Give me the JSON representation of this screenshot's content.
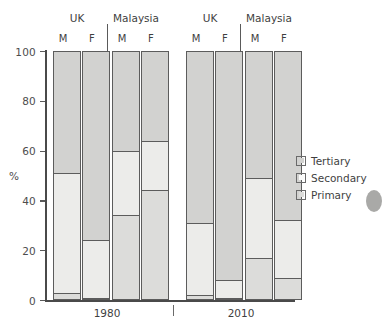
{
  "chart_data": {
    "type": "bar",
    "subtype": "stacked-100-percent",
    "title": "",
    "xlabel": "",
    "ylabel": "%",
    "ylim": [
      0,
      100
    ],
    "yticks": [
      0,
      20,
      40,
      60,
      80,
      100
    ],
    "grid": false,
    "legend_position": "right",
    "groups": [
      {
        "period": "1980",
        "countries": [
          {
            "name": "UK",
            "bars": [
              {
                "sex": "M",
                "primary": 3,
                "secondary": 48,
                "tertiary": 49,
                "cum_primary_top": 3,
                "cum_secondary_top": 51
              },
              {
                "sex": "F",
                "primary": 1,
                "secondary": 23,
                "tertiary": 76,
                "cum_primary_top": 1,
                "cum_secondary_top": 24
              }
            ]
          },
          {
            "name": "Malaysia",
            "bars": [
              {
                "sex": "M",
                "primary": 34,
                "secondary": 26,
                "tertiary": 40,
                "cum_primary_top": 34,
                "cum_secondary_top": 60
              },
              {
                "sex": "F",
                "primary": 44,
                "secondary": 20,
                "tertiary": 36,
                "cum_primary_top": 44,
                "cum_secondary_top": 64
              }
            ]
          }
        ]
      },
      {
        "period": "2010",
        "countries": [
          {
            "name": "UK",
            "bars": [
              {
                "sex": "M",
                "primary": 2,
                "secondary": 29,
                "tertiary": 69,
                "cum_primary_top": 2,
                "cum_secondary_top": 31
              },
              {
                "sex": "F",
                "primary": 1,
                "secondary": 7,
                "tertiary": 92,
                "cum_primary_top": 1,
                "cum_secondary_top": 8
              }
            ]
          },
          {
            "name": "Malaysia",
            "bars": [
              {
                "sex": "M",
                "primary": 17,
                "secondary": 32,
                "tertiary": 51,
                "cum_primary_top": 17,
                "cum_secondary_top": 49
              },
              {
                "sex": "F",
                "primary": 9,
                "secondary": 23,
                "tertiary": 68,
                "cum_primary_top": 9,
                "cum_secondary_top": 32
              }
            ]
          }
        ]
      }
    ],
    "series": [
      {
        "name": "Tertiary",
        "color": "#d2d2d0",
        "values": [
          49,
          76,
          40,
          36,
          69,
          92,
          51,
          68
        ]
      },
      {
        "name": "Secondary",
        "color": "#ececea",
        "values": [
          48,
          23,
          26,
          20,
          29,
          7,
          32,
          23
        ]
      },
      {
        "name": "Primary",
        "color": "#dcdcda",
        "values": [
          3,
          1,
          34,
          44,
          2,
          1,
          17,
          9
        ]
      }
    ],
    "categories": [
      "1980 UK M",
      "1980 UK F",
      "1980 Malaysia M",
      "1980 Malaysia F",
      "2010 UK M",
      "2010 UK F",
      "2010 Malaysia M",
      "2010 Malaysia F"
    ]
  },
  "axis": {
    "unit_label": "%",
    "tick_labels": [
      "100",
      "80",
      "60",
      "40",
      "20",
      "0"
    ]
  },
  "group_headers": [
    {
      "country": "UK",
      "period": "1980"
    },
    {
      "country": "Malaysia",
      "period": "1980"
    },
    {
      "country": "UK",
      "period": "2010"
    },
    {
      "country": "Malaysia",
      "period": "2010"
    }
  ],
  "sex_labels": [
    "M",
    "F",
    "M",
    "F",
    "M",
    "F",
    "M",
    "F"
  ],
  "period_labels": [
    "1980",
    "2010"
  ],
  "legend": {
    "items": [
      {
        "label": "Tertiary",
        "color": "#d2d2d0"
      },
      {
        "label": "Secondary",
        "color": "#fbfbfa"
      },
      {
        "label": "Primary",
        "color": "#dcdcda"
      }
    ]
  }
}
